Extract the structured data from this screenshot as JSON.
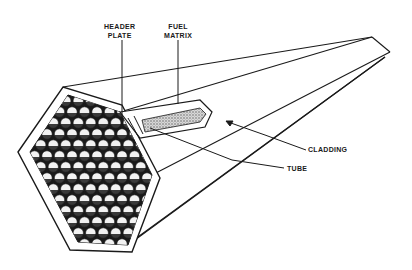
{
  "figure": {
    "labels": {
      "header_plate": [
        "HEADER",
        "PLATE"
      ],
      "fuel_matrix": [
        "FUEL",
        "MATRIX"
      ],
      "cladding": "CLADDING",
      "tube": "TUBE"
    },
    "colors": {
      "ink": "#1a1a1a",
      "background": "#ffffff",
      "ball": "#f2f2f2"
    }
  }
}
